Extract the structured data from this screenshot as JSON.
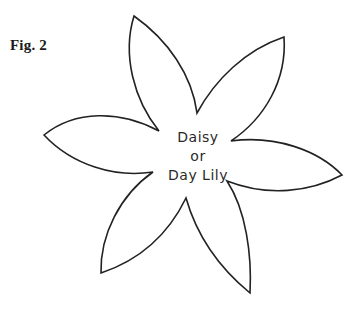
{
  "figure": {
    "label": "Fig. 2",
    "title_lines": [
      "Daisy",
      "or",
      "Day Lily"
    ]
  },
  "diagram": {
    "type": "petal-template",
    "petal_count": 6,
    "stroke_color": "#222222",
    "fill_color": "#ffffff",
    "petals": [
      {
        "name": "top",
        "tip": [
          134,
          16
        ]
      },
      {
        "name": "upper-right",
        "tip": [
          284,
          37
        ]
      },
      {
        "name": "right",
        "tip": [
          342,
          175
        ]
      },
      {
        "name": "bottom-right",
        "tip": [
          250,
          293
        ]
      },
      {
        "name": "bottom-left",
        "tip": [
          101,
          273
        ]
      },
      {
        "name": "left",
        "tip": [
          44,
          135
        ]
      }
    ]
  }
}
